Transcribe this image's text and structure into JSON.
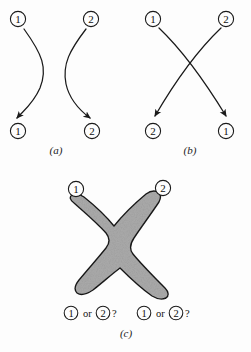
{
  "figure": {
    "background_color": "#fdfdfd",
    "ink_color": "#1a1a1a",
    "blob_fill_color": "#ababab",
    "blob_stroke_color": "#1a1a1a"
  },
  "panel_a": {
    "caption": "(a)",
    "top_labels": [
      "1",
      "2"
    ],
    "bottom_labels": [
      "1",
      "2"
    ],
    "description": "two non-crossing curved arrows"
  },
  "panel_b": {
    "caption": "(b)",
    "top_labels": [
      "1",
      "2"
    ],
    "bottom_labels": [
      "2",
      "1"
    ],
    "description": "two crossing curved arrows"
  },
  "panel_c": {
    "caption": "(c)",
    "top_labels": [
      "1",
      "2"
    ],
    "question_left": {
      "first": "1",
      "conjunction": "or",
      "second": "2",
      "mark": "?"
    },
    "question_right": {
      "first": "1",
      "conjunction": "or",
      "second": "2",
      "mark": "?"
    },
    "description": "merged X-shaped gray blob with ambiguous outgoing identities"
  }
}
